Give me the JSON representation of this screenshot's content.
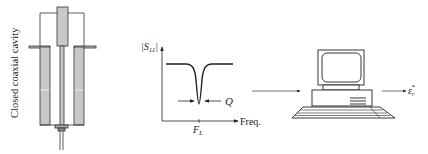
{
  "diagram": {
    "cavity_label": "Closed coaxial cavity",
    "plot": {
      "y_axis_label": "|S",
      "y_axis_sub": "11",
      "y_axis_close": "|",
      "x_axis_label": "Freq.",
      "q_label": "Q",
      "fl_label": "F",
      "fl_sub": "L"
    },
    "output_label": "ε",
    "output_sub": "r",
    "output_sup": "*",
    "colors": {
      "line": "#222222",
      "metal_fill": "#c8c8c8"
    }
  }
}
